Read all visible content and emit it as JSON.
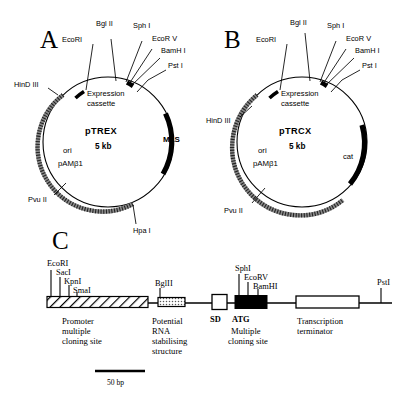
{
  "figure": {
    "panels": [
      {
        "letter": "A",
        "plasmid_name": "pTREX",
        "plasmid_size": "5 kb",
        "cassette_label_line1": "Expression",
        "cassette_label_line2": "cassette",
        "ori_line1": "ori",
        "ori_line2": "pAMβ1",
        "marker_label": "MLS",
        "top_sites": [
          "EcoRI",
          "Bgl II",
          "Sph I",
          "EcoR V",
          "BamH I",
          "Pst I"
        ],
        "left_site": "HinD III",
        "lower_left_site": "Pvu II",
        "bottom_site": "Hpa I"
      },
      {
        "letter": "B",
        "plasmid_name": "pTRCX",
        "plasmid_size": "5 kb",
        "cassette_label_line1": "Expression",
        "cassette_label_line2": "cassette",
        "ori_line1": "ori",
        "ori_line2": "pAMβ1",
        "marker_label": "cat",
        "top_sites": [
          "EcoRI",
          "Bgl II",
          "Sph I",
          "EcoR V",
          "BamH I",
          "Pst I"
        ],
        "left_site": "HinD III",
        "lower_left_site": "Pvu II",
        "bottom_site": ""
      }
    ],
    "panel_c": {
      "letter": "C",
      "left_sites": [
        "EcoRI",
        "SacI",
        "KpnI",
        "SmaI"
      ],
      "mid_site": "BglII",
      "mcs_sites": [
        "SphI",
        "EcoRV",
        "BamHI"
      ],
      "right_site": "PstI",
      "sd_label": "SD",
      "atg_label": "ATG",
      "features": [
        {
          "name": "promoter",
          "lines": [
            "Promoter",
            "multiple",
            "cloning site"
          ]
        },
        {
          "name": "rna-structure",
          "lines": [
            "Potential",
            "RNA",
            "stabilising",
            "structure"
          ]
        },
        {
          "name": "mcs",
          "lines": [
            "Multiple",
            "cloning site"
          ]
        },
        {
          "name": "terminator",
          "lines": [
            "Transcription",
            "terminator"
          ]
        }
      ],
      "scale_label": "50 bp"
    },
    "colors": {
      "ink": "#000000",
      "ori_arc": "#7a7a7a",
      "background": "#ffffff"
    }
  }
}
